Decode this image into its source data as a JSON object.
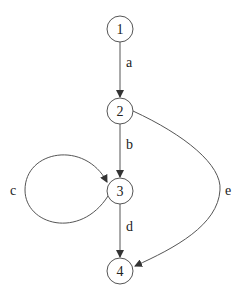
{
  "graph": {
    "nodes": [
      {
        "id": "1",
        "label": "1",
        "cx": 120,
        "cy": 29
      },
      {
        "id": "2",
        "label": "2",
        "cx": 120,
        "cy": 111
      },
      {
        "id": "3",
        "label": "3",
        "cx": 120,
        "cy": 191
      },
      {
        "id": "4",
        "label": "4",
        "cx": 120,
        "cy": 271
      }
    ],
    "edges": [
      {
        "id": "a",
        "label": "a",
        "from": "1",
        "to": "2"
      },
      {
        "id": "b",
        "label": "b",
        "from": "2",
        "to": "3"
      },
      {
        "id": "c",
        "label": "c",
        "from": "3",
        "to": "3"
      },
      {
        "id": "d",
        "label": "d",
        "from": "3",
        "to": "4"
      },
      {
        "id": "e",
        "label": "e",
        "from": "2",
        "to": "4"
      }
    ]
  }
}
